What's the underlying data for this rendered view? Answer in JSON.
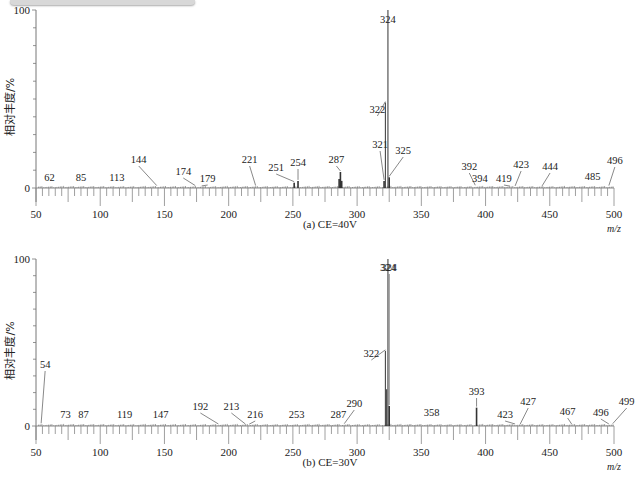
{
  "header_fragment": "",
  "chart_data": [
    {
      "type": "bar",
      "title": "(a) CE=40V",
      "xlabel": "m/z",
      "ylabel": "相对丰度/%",
      "xlim": [
        50,
        500
      ],
      "ylim": [
        0,
        100
      ],
      "x_ticks": [
        50,
        100,
        150,
        200,
        250,
        300,
        350,
        400,
        450,
        500
      ],
      "y_ticks": [
        0,
        100
      ],
      "grid": false,
      "peaks": [
        {
          "mz": 62,
          "intensity": 0.5,
          "label": "62"
        },
        {
          "mz": 85,
          "intensity": 0.5,
          "label": "85"
        },
        {
          "mz": 113,
          "intensity": 0.5,
          "label": "113"
        },
        {
          "mz": 144,
          "intensity": 0.8,
          "label": "144"
        },
        {
          "mz": 174,
          "intensity": 0.8,
          "label": "174"
        },
        {
          "mz": 179,
          "intensity": 0.6,
          "label": "179"
        },
        {
          "mz": 221,
          "intensity": 0.8,
          "label": "221"
        },
        {
          "mz": 251,
          "intensity": 3,
          "label": "251"
        },
        {
          "mz": 254,
          "intensity": 4,
          "label": "254"
        },
        {
          "mz": 286,
          "intensity": 5,
          "label": ""
        },
        {
          "mz": 287,
          "intensity": 9,
          "label": "287"
        },
        {
          "mz": 288,
          "intensity": 4,
          "label": ""
        },
        {
          "mz": 321,
          "intensity": 4,
          "label": "321"
        },
        {
          "mz": 322,
          "intensity": 48,
          "label": "322"
        },
        {
          "mz": 324,
          "intensity": 100,
          "label": "324"
        },
        {
          "mz": 325,
          "intensity": 6,
          "label": "325"
        },
        {
          "mz": 392,
          "intensity": 1,
          "label": "392"
        },
        {
          "mz": 394,
          "intensity": 0.6,
          "label": "394"
        },
        {
          "mz": 419,
          "intensity": 0.5,
          "label": "419"
        },
        {
          "mz": 423,
          "intensity": 0.6,
          "label": "423"
        },
        {
          "mz": 444,
          "intensity": 0.6,
          "label": "444"
        },
        {
          "mz": 485,
          "intensity": 0.5,
          "label": "485"
        },
        {
          "mz": 496,
          "intensity": 0.8,
          "label": "496"
        }
      ]
    },
    {
      "type": "bar",
      "title": "(b) CE=30V",
      "xlabel": "m/z",
      "ylabel": "相对丰度/%",
      "xlim": [
        50,
        500
      ],
      "ylim": [
        0,
        100
      ],
      "x_ticks": [
        50,
        100,
        150,
        200,
        250,
        300,
        350,
        400,
        450,
        500
      ],
      "y_ticks": [
        0,
        100
      ],
      "grid": false,
      "peaks": [
        {
          "mz": 54,
          "intensity": 1,
          "label": "54"
        },
        {
          "mz": 73,
          "intensity": 0.5,
          "label": "73"
        },
        {
          "mz": 87,
          "intensity": 0.5,
          "label": "87"
        },
        {
          "mz": 119,
          "intensity": 0.5,
          "label": "119"
        },
        {
          "mz": 147,
          "intensity": 0.5,
          "label": "147"
        },
        {
          "mz": 192,
          "intensity": 0.6,
          "label": "192"
        },
        {
          "mz": 213,
          "intensity": 0.6,
          "label": "213"
        },
        {
          "mz": 216,
          "intensity": 0.5,
          "label": "216"
        },
        {
          "mz": 253,
          "intensity": 0.6,
          "label": "253"
        },
        {
          "mz": 287,
          "intensity": 1,
          "label": "287"
        },
        {
          "mz": 290,
          "intensity": 0.8,
          "label": "290"
        },
        {
          "mz": 322,
          "intensity": 45,
          "label": "322"
        },
        {
          "mz": 323,
          "intensity": 22,
          "label": ""
        },
        {
          "mz": 324,
          "intensity": 100,
          "label": "324"
        },
        {
          "mz": 325,
          "intensity": 12,
          "label": "324"
        },
        {
          "mz": 358,
          "intensity": 0.6,
          "label": "358"
        },
        {
          "mz": 393,
          "intensity": 11,
          "label": "393"
        },
        {
          "mz": 423,
          "intensity": 0.6,
          "label": "423"
        },
        {
          "mz": 427,
          "intensity": 0.6,
          "label": "427"
        },
        {
          "mz": 467,
          "intensity": 0.6,
          "label": "467"
        },
        {
          "mz": 496,
          "intensity": 0.6,
          "label": "496"
        },
        {
          "mz": 499,
          "intensity": 0.8,
          "label": "499"
        }
      ]
    }
  ],
  "charts": {
    "a": {
      "caption": "(a) CE=40V",
      "ylabel": "相对丰度/%",
      "unit": "m/z",
      "y_top": "100",
      "y_zero": "0"
    },
    "b": {
      "caption": "(b) CE=30V",
      "ylabel": "相对丰度/%",
      "unit": "m/z",
      "y_top": "100",
      "y_zero": "0"
    }
  }
}
